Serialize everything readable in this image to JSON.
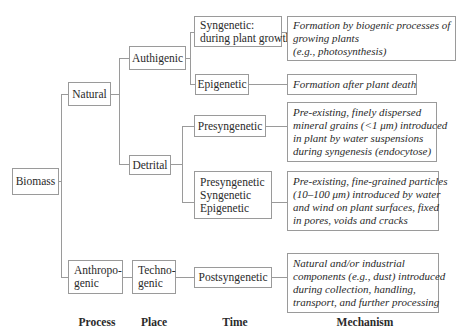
{
  "root": {
    "label": "Biomass"
  },
  "process": {
    "natural": "Natural",
    "anthropogenic": [
      "Anthropo-",
      "genic"
    ]
  },
  "place": {
    "authigenic": "Authigenic",
    "detrital": "Detrital",
    "technogenic": [
      "Techno-",
      "genic"
    ]
  },
  "time": {
    "syngenetic": [
      "Syngenetic:",
      "during plant growth"
    ],
    "epigenetic": "Epigenetic",
    "presyngenetic": "Presyngenetic",
    "presyn_syn_epi": [
      "Presyngenetic",
      "Syngenetic",
      "Epigenetic"
    ],
    "postsyngenetic": "Postsyngenetic"
  },
  "mechanism": {
    "syngenetic": [
      "Formation by biogenic processes of",
      "growing plants",
      "(e.g., photosynthesis)"
    ],
    "epigenetic": [
      "Formation after plant death"
    ],
    "presyngenetic": [
      "Pre-existing, finely dispersed",
      "mineral grains (<1 μm) introduced",
      "in plant by water suspensions",
      "during syngenesis (endocytose)"
    ],
    "presyn_syn_epi": [
      "Pre-existing, fine-grained particles",
      "(10–100 μm) introduced by water",
      "and wind on plant surfaces, fixed",
      "in pores, voids and cracks"
    ],
    "postsyngenetic": [
      "Natural and/or industrial",
      "components (e.g., dust) introduced",
      "during collection, handling,",
      "transport, and further processing"
    ]
  },
  "axis_labels": {
    "process": "Process",
    "place": "Place",
    "time": "Time",
    "mechanism": "Mechanism"
  }
}
